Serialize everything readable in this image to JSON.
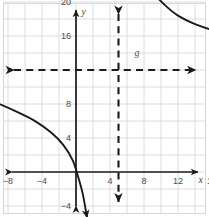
{
  "figure": {
    "kind": "coordinate-plane-graph",
    "background_color": "#ffffff",
    "grid_color": "#d8d6e0",
    "axis_color": "#1a1a1a",
    "curve_color": "#1a1a1a",
    "label_color": "#4a4a52"
  },
  "axes": {
    "x_axis_label": "x",
    "y_axis_label": "y",
    "x_ticks": [
      {
        "value": -8,
        "label": "−8"
      },
      {
        "value": -4,
        "label": "−4"
      },
      {
        "value": 4,
        "label": "4"
      },
      {
        "value": 8,
        "label": "8"
      },
      {
        "value": 12,
        "label": "12"
      },
      {
        "value": 16,
        "label": "16"
      },
      {
        "value": 20,
        "label": "20"
      }
    ],
    "y_ticks": [
      {
        "value": 24,
        "label": "24"
      },
      {
        "value": 20,
        "label": "20"
      },
      {
        "value": 16,
        "label": "16"
      },
      {
        "value": 8,
        "label": "8"
      },
      {
        "value": 4,
        "label": "4"
      },
      {
        "value": -4,
        "label": "−4"
      }
    ]
  },
  "chart_data": {
    "type": "line",
    "title": "",
    "xlabel": "x",
    "ylabel": "y",
    "xlim": [
      -11,
      22
    ],
    "ylim": [
      -6,
      29
    ],
    "grid": true,
    "grid_step": 2,
    "tick_step": 4,
    "legend_position": "inline-label",
    "asymptotes": [
      {
        "name": "horizontal-asymptote",
        "orientation": "horizontal",
        "value": 12,
        "style": "dashed",
        "label": "y = 12"
      },
      {
        "name": "vertical-asymptote",
        "orientation": "vertical",
        "value": 5,
        "style": "dashed",
        "label": "x = 5"
      }
    ],
    "series": [
      {
        "name": "g",
        "label": "g",
        "branch": "right",
        "shape": "decreasing-logarithmic-branch",
        "points": [
          {
            "x": 6.6,
            "y": 28.6
          },
          {
            "x": 7.2,
            "y": 25.5
          },
          {
            "x": 8.0,
            "y": 23.0
          },
          {
            "x": 9.0,
            "y": 21.2
          },
          {
            "x": 10.5,
            "y": 19.6
          },
          {
            "x": 12.0,
            "y": 18.4
          },
          {
            "x": 14.0,
            "y": 17.4
          },
          {
            "x": 16.5,
            "y": 16.6
          },
          {
            "x": 19.0,
            "y": 16.1
          },
          {
            "x": 21.3,
            "y": 15.8
          }
        ],
        "arrow_start": true,
        "arrow_end": true
      },
      {
        "name": "left-branch",
        "label": "",
        "branch": "left",
        "shape": "decreasing-logarithmic-branch",
        "points": [
          {
            "x": -10.6,
            "y": 8.6
          },
          {
            "x": -9.0,
            "y": 8.0
          },
          {
            "x": -7.0,
            "y": 7.1
          },
          {
            "x": -5.0,
            "y": 6.1
          },
          {
            "x": -3.0,
            "y": 4.7
          },
          {
            "x": -1.5,
            "y": 3.2
          },
          {
            "x": -0.4,
            "y": 1.4
          },
          {
            "x": 0.2,
            "y": -0.4
          },
          {
            "x": 0.8,
            "y": -2.6
          },
          {
            "x": 1.3,
            "y": -5.4
          }
        ],
        "arrow_start": true,
        "arrow_end": true
      }
    ]
  }
}
